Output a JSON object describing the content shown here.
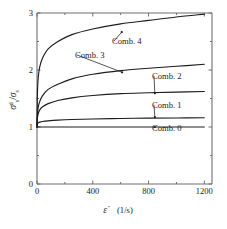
{
  "chart_data": {
    "type": "line",
    "title": "",
    "subtitle": "",
    "xlabel": "ε̇  (1/s)",
    "xlabel_symbol": "ε̇",
    "xlabel_unit": "(1/s)",
    "ylabel": "σₛᵈ / σₛ",
    "ylabel_numerator_symbol": "σ",
    "ylabel_numerator_sub": "s",
    "ylabel_numerator_sup": "d",
    "ylabel_divider": "/",
    "ylabel_denominator_symbol": "σ",
    "ylabel_denominator_sub": "s",
    "xlim": [
      0,
      1255
    ],
    "ylim": [
      0,
      3
    ],
    "xticks": [
      0,
      400,
      800,
      1200
    ],
    "xticklabels": [
      "0",
      "400",
      "800",
      "1200"
    ],
    "yticks": [
      0,
      1,
      2,
      3
    ],
    "yticklabels": [
      "0",
      "1",
      "2",
      "3"
    ],
    "grid": false,
    "legend": "inline-annotations",
    "series": [
      {
        "name": "Comb. 0",
        "label": "Comb. 0",
        "color": "#1c1c1c",
        "end_value": 1.0,
        "x": [
          0,
          5,
          20,
          50,
          100,
          200,
          300,
          400,
          600,
          800,
          1000,
          1200
        ],
        "values": [
          1.0,
          1.0,
          1.0,
          1.0,
          1.0,
          1.0,
          1.0,
          1.0,
          1.0,
          1.0,
          1.0,
          1.0
        ],
        "annotation_x": 845,
        "annotation_y": 1.0,
        "label_x": 152,
        "label_y": 131
      },
      {
        "name": "Comb. 1",
        "label": "Comb. 1",
        "color": "#1c1c1c",
        "end_value": 1.16,
        "x": [
          0,
          2,
          5,
          10,
          20,
          40,
          80,
          150,
          250,
          400,
          600,
          800,
          1000,
          1200
        ],
        "values": [
          1.0,
          1.045,
          1.062,
          1.074,
          1.085,
          1.097,
          1.108,
          1.12,
          1.131,
          1.141,
          1.15,
          1.155,
          1.158,
          1.162
        ],
        "annotation_x": 845,
        "annotation_y": 1.175,
        "label_x": 152,
        "label_y": 108
      },
      {
        "name": "Comb. 2",
        "label": "Comb. 2",
        "color": "#1c1c1c",
        "end_value": 1.62,
        "x": [
          0,
          2,
          5,
          10,
          20,
          40,
          80,
          150,
          250,
          400,
          600,
          800,
          1000,
          1200
        ],
        "values": [
          1.0,
          1.13,
          1.19,
          1.245,
          1.3,
          1.355,
          1.41,
          1.465,
          1.512,
          1.552,
          1.585,
          1.6,
          1.612,
          1.622
        ],
        "annotation_x": 845,
        "annotation_y": 1.59,
        "label_x": 152,
        "label_y": 79
      },
      {
        "name": "Comb. 3",
        "label": "Comb. 3",
        "color": "#1c1c1c",
        "end_value": 2.1,
        "x": [
          0,
          2,
          5,
          10,
          20,
          40,
          80,
          150,
          250,
          400,
          600,
          800,
          1000,
          1200
        ],
        "values": [
          1.0,
          1.16,
          1.27,
          1.36,
          1.45,
          1.55,
          1.66,
          1.75,
          1.845,
          1.925,
          1.99,
          2.03,
          2.065,
          2.1
        ],
        "annotation_x": 610,
        "annotation_y": 1.96,
        "label_x": 75,
        "label_y": 58
      },
      {
        "name": "Comb. 4",
        "label": "Comb. 4",
        "color": "#1c1c1c",
        "end_value": 2.98,
        "x": [
          0,
          2,
          5,
          10,
          20,
          40,
          80,
          150,
          250,
          400,
          600,
          800,
          1000,
          1200
        ],
        "values": [
          1.0,
          1.5,
          1.72,
          1.9,
          2.06,
          2.21,
          2.37,
          2.5,
          2.62,
          2.72,
          2.81,
          2.87,
          2.93,
          2.98
        ],
        "annotation_x": 608,
        "annotation_y": 2.665,
        "label_x": 112,
        "label_y": 44
      }
    ]
  },
  "figure": {
    "plot_left_px": 37,
    "plot_right_px": 212,
    "plot_top_px": 13,
    "plot_bottom_px": 184,
    "background_color": "#ffffff",
    "axis_color": "#6f6f6f",
    "curve_color": "#1c1c1c"
  }
}
